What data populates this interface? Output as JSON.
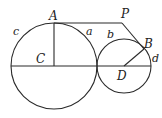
{
  "diagram": {
    "type": "geometry",
    "points": {
      "A": {
        "label": "A",
        "x": 54,
        "y": 23
      },
      "P": {
        "label": "P",
        "x": 122,
        "y": 23
      },
      "B": {
        "label": "B",
        "x": 143,
        "y": 47
      },
      "C": {
        "label": "C",
        "x": 54,
        "y": 66
      },
      "D": {
        "label": "D",
        "x": 124,
        "y": 66
      }
    },
    "circles": [
      {
        "name": "large-circle",
        "center": "C",
        "radius": 43
      },
      {
        "name": "small-circle",
        "center": "D",
        "radius": 27
      }
    ],
    "labels": {
      "A": "A",
      "P": "P",
      "B": "B",
      "C": "C",
      "D": "D",
      "a": "a",
      "b": "b",
      "c": "c",
      "d": "d"
    },
    "colors": {
      "stroke": "#2a2a2a",
      "background": "#ffffff",
      "text": "#222222"
    }
  }
}
